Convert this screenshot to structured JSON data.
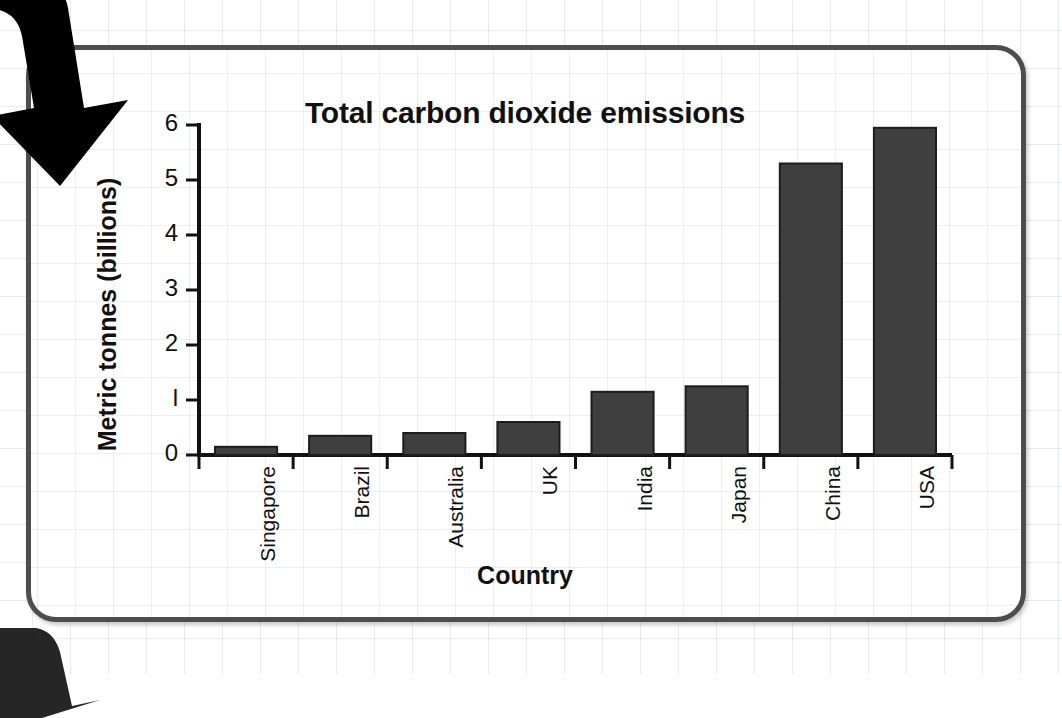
{
  "card": {
    "border_color": "#4d4d4d",
    "background": "#ffffff"
  },
  "decorations": [
    {
      "name": "arrow-top-left",
      "shape": "curved-down-arrow",
      "color": "#000000"
    },
    {
      "name": "arrow-bottom-left",
      "shape": "curved-arrow-partial",
      "color": "#000000"
    }
  ],
  "chart_data": {
    "type": "bar",
    "title": "Total carbon dioxide emissions",
    "xlabel": "Country",
    "ylabel": "Metric tonnes (billions)",
    "categories": [
      "Singapore",
      "Brazil",
      "Australia",
      "UK",
      "India",
      "Japan",
      "China",
      "USA"
    ],
    "values": [
      0.15,
      0.35,
      0.4,
      0.6,
      1.15,
      1.25,
      5.3,
      5.95
    ],
    "ylim": [
      0,
      6
    ],
    "yticks": [
      0,
      1,
      2,
      3,
      4,
      5,
      6
    ],
    "ytick_labels": [
      "0",
      "l",
      "2",
      "3",
      "4",
      "5",
      "6"
    ],
    "grid": false,
    "legend": null,
    "bar_color": "#3f3f3f",
    "bar_edge_color": "#1d1d1d",
    "axis_color": "#111111",
    "x_tick_style": "between-categories",
    "xlabel_rotation": 90
  }
}
